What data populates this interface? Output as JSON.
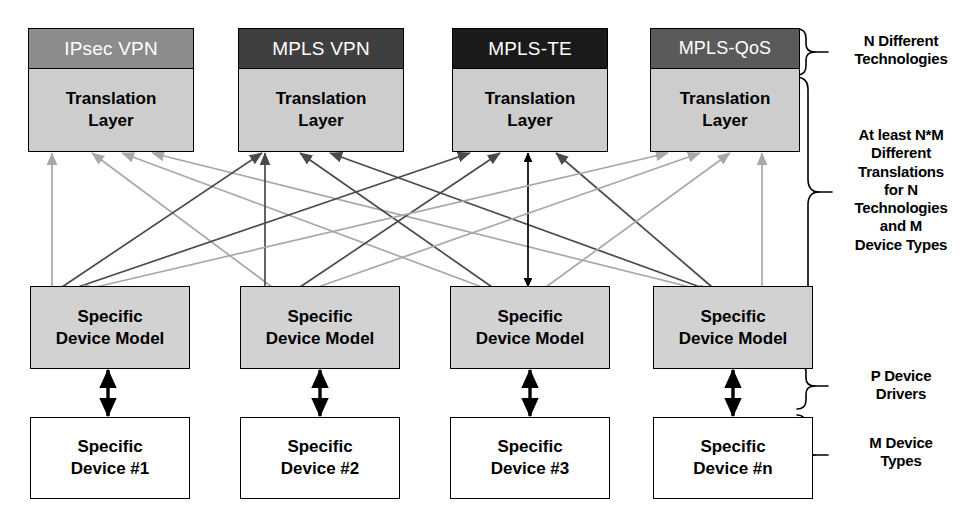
{
  "diagram": {
    "colors": {
      "header_ipsec": "#8c8c8c",
      "header_mpls_vpn": "#3f3f3f",
      "header_mpls_te": "#1a1a1a",
      "header_mpls_qos": "#5a5a5a",
      "translation_fill": "#cdcdcd",
      "model_fill": "#d2d2d2",
      "device_fill": "#ffffff",
      "outline": "#000000",
      "arrow_light": "#a8a8a8",
      "arrow_dark": "#4a4a4a",
      "arrow_black": "#000000"
    },
    "columns": [
      {
        "id": "ipsec-vpn",
        "technology": "IPsec VPN",
        "header_color": "#8c8c8c",
        "translation_line1": "Translation",
        "translation_line2": "Layer",
        "model_line1": "Specific",
        "model_line2": "Device Model",
        "device_line1": "Specific",
        "device_line2": "Device #1"
      },
      {
        "id": "mpls-vpn",
        "technology": "MPLS VPN",
        "header_color": "#3f3f3f",
        "translation_line1": "Translation",
        "translation_line2": "Layer",
        "model_line1": "Specific",
        "model_line2": "Device Model",
        "device_line1": "Specific",
        "device_line2": "Device #2"
      },
      {
        "id": "mpls-te",
        "technology": "MPLS-TE",
        "header_color": "#1a1a1a",
        "translation_line1": "Translation",
        "translation_line2": "Layer",
        "model_line1": "Specific",
        "model_line2": "Device Model",
        "device_line1": "Specific",
        "device_line2": "Device #3"
      },
      {
        "id": "mpls-qos",
        "technology": "MPLS-QoS",
        "header_color": "#5a5a5a",
        "translation_line1": "Translation",
        "translation_line2": "Layer",
        "model_line1": "Specific",
        "model_line2": "Device Model",
        "device_line1": "Specific",
        "device_line2": "Device #n"
      }
    ],
    "annotations": [
      {
        "id": "n-different-technologies",
        "lines": [
          "N Different",
          "Technologies"
        ]
      },
      {
        "id": "at-least-nm-translations",
        "lines": [
          "At least N*M",
          "Different",
          "Translations",
          "for N",
          "Technologies",
          "and M",
          "Device Types"
        ]
      },
      {
        "id": "p-device-drivers",
        "lines": [
          "P Device",
          "Drivers"
        ]
      },
      {
        "id": "m-device-types",
        "lines": [
          "M Device",
          "Types"
        ]
      }
    ]
  }
}
